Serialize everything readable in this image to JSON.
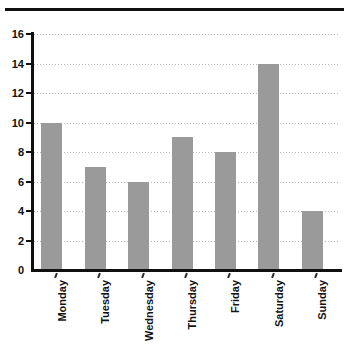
{
  "top_fragment_text": "",
  "chart_data": {
    "type": "bar",
    "title": "",
    "xlabel": "",
    "ylabel": "",
    "categories": [
      "Monday",
      "Tuesday",
      "Wednesday",
      "Thursday",
      "Friday",
      "Saturday",
      "Sunday"
    ],
    "values": [
      10,
      7,
      6,
      9,
      8,
      14,
      4
    ],
    "ylim": [
      0,
      16
    ],
    "ytick_labels": [
      "0",
      "2",
      "4",
      "6",
      "8",
      "10",
      "12",
      "14",
      "16"
    ],
    "ytick_values": [
      0,
      2,
      4,
      6,
      8,
      10,
      12,
      14,
      16
    ],
    "grid": true,
    "grid_axis": "y",
    "grid_style": "dotted",
    "legend": false,
    "bar_color": "#9a9a9a",
    "grid_color": "#b8b8b8",
    "axis_color": "#101010",
    "background_color": "#ffffff",
    "xtick_label_rotation": 90
  }
}
